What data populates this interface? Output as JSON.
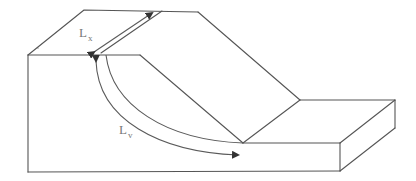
{
  "diagram": {
    "type": "slope block diagram",
    "labels": {
      "lx": {
        "main": "L",
        "sub": "x"
      },
      "lv": {
        "main": "L",
        "sub": "v"
      }
    },
    "colors": {
      "line": "#555555",
      "label": "#777777",
      "background": "#ffffff"
    }
  }
}
